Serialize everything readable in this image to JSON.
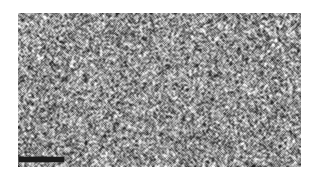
{
  "figure": {
    "kind": "electron-micrograph",
    "caption": "",
    "label": "",
    "background_color": "#ffffff"
  },
  "micrograph": {
    "alt_text": "Grayscale electron micrograph showing a dense, fine-grained speckled nanostructure filling the entire frame",
    "frame": {
      "x": 18,
      "y": 13,
      "width": 283,
      "height": 154
    },
    "appearance": {
      "modality": "grayscale",
      "mean_gray": "#8e8e8e",
      "dark_tone": "#3a3a3a",
      "light_tone": "#e2e2e2",
      "texture": "fine isotropic speckle / granular contrast",
      "grain_size_px": 1.6,
      "contrast": "high",
      "border": "none"
    }
  },
  "scale_bar": {
    "visible": true,
    "label": "",
    "color": "#1b1b1b",
    "position": "bottom-left",
    "x": 19,
    "y": 157,
    "length_px": 45,
    "thickness_px": 5
  }
}
